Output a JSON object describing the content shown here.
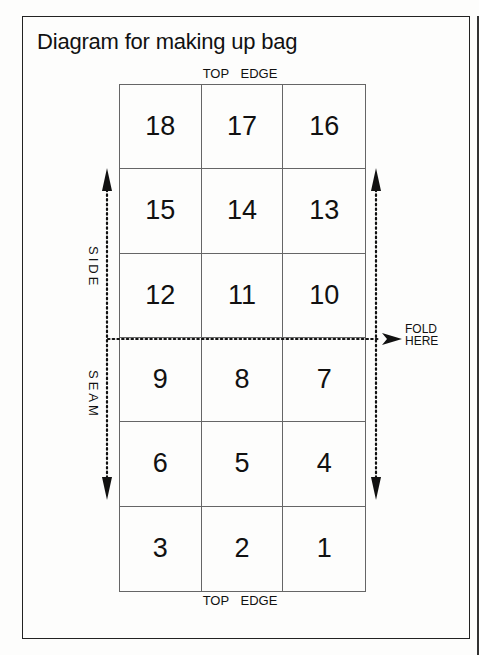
{
  "title": "Diagram for making up bag",
  "labels": {
    "top_edge_top": "TOP EDGE",
    "top_edge_bottom": "TOP EDGE",
    "side": "SIDE",
    "seam": "SEAM",
    "fold_line1": "FOLD",
    "fold_line2": "HERE"
  },
  "grid": {
    "rows": 6,
    "cols": 3,
    "cells": [
      "18",
      "17",
      "16",
      "15",
      "14",
      "13",
      "12",
      "11",
      "10",
      "9",
      "8",
      "7",
      "6",
      "5",
      "4",
      "3",
      "2",
      "1"
    ]
  },
  "arrows": {
    "left": "double-headed dotted vertical arrow (side seam)",
    "right": "double-headed dotted vertical arrow",
    "fold": "dotted horizontal line with arrowhead pointing right to fold label"
  }
}
